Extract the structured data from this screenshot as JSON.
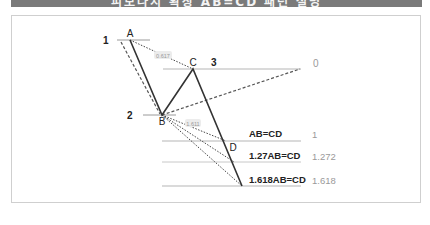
{
  "banner": {
    "text": "피보나치 확장 AB=CD 패턴 설명"
  },
  "diagram": {
    "points": [
      {
        "label": "A",
        "x": 130,
        "y": 40
      },
      {
        "label": "B",
        "x": 162,
        "y": 115
      },
      {
        "label": "C",
        "x": 193,
        "y": 69
      },
      {
        "label": "D",
        "x": 226,
        "y": 141
      }
    ],
    "level_numbers": [
      {
        "label": "1",
        "x": 103,
        "y": 44
      },
      {
        "label": "2",
        "x": 127,
        "y": 119
      },
      {
        "label": "3",
        "x": 211,
        "y": 66
      }
    ],
    "ratio_tags": [
      {
        "label": "0.617",
        "x": 163,
        "y": 56
      },
      {
        "label": "1.611",
        "x": 193,
        "y": 124
      }
    ],
    "extension_labels": [
      {
        "label": "AB=CD",
        "value": "1",
        "y": 141
      },
      {
        "label": "1.27AB=CD",
        "value": "1.272",
        "y": 162
      },
      {
        "label": "1.618AB=CD",
        "value": "1.618",
        "y": 186
      }
    ],
    "zero_level": {
      "value": "0",
      "y": 69
    },
    "colors": {
      "line": "#333333",
      "guide": "#b5b5b5",
      "dashed": "#555555",
      "dotted": "#444444",
      "value_text": "#9a9a9a",
      "banner": "#7a7a7a"
    }
  }
}
